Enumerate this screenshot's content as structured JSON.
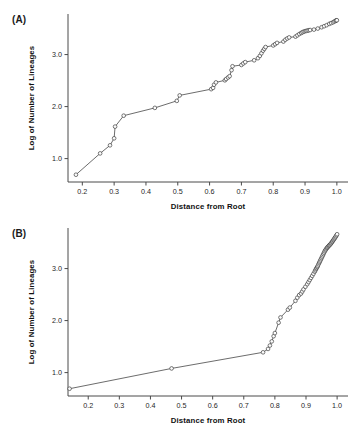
{
  "figure": {
    "background": "#ffffff",
    "line_color": "#3b3b3b",
    "marker_edge_color": "#2a2a2a",
    "marker_face_color": "#fbfbfb",
    "axis_color": "#4a4a4a"
  },
  "panels": [
    {
      "id": "A",
      "label": "(A)"
    },
    {
      "id": "B",
      "label": "(B)"
    }
  ],
  "chart_data": [
    {
      "type": "line",
      "panel": "A",
      "title": "(A)",
      "xlabel": "Distance from Root",
      "ylabel": "Log of Number of Lineages",
      "xlim": [
        0.155,
        1.035
      ],
      "ylim": [
        0.55,
        3.78
      ],
      "xticks": [
        0.2,
        0.3,
        0.4,
        0.5,
        0.6,
        0.7,
        0.8,
        0.9,
        1.0
      ],
      "xticklabels": [
        "0.2",
        "0.3",
        "0.4",
        "0.5",
        "0.6",
        "0.7",
        "0.8",
        "0.9",
        "1.0"
      ],
      "yticks": [
        1.0,
        2.0,
        3.0
      ],
      "yticklabels": [
        "1.0",
        "2.0",
        "3.0"
      ],
      "grid": false,
      "legend": "none",
      "marker": "open-circle",
      "x": [
        0.18,
        0.256,
        0.287,
        0.3,
        0.303,
        0.33,
        0.428,
        0.497,
        0.506,
        0.605,
        0.611,
        0.614,
        0.62,
        0.648,
        0.652,
        0.658,
        0.663,
        0.669,
        0.672,
        0.7,
        0.706,
        0.712,
        0.74,
        0.752,
        0.758,
        0.763,
        0.768,
        0.772,
        0.776,
        0.8,
        0.806,
        0.812,
        0.832,
        0.838,
        0.844,
        0.85,
        0.87,
        0.876,
        0.882,
        0.888,
        0.892,
        0.896,
        0.9,
        0.904,
        0.908,
        0.912,
        0.916,
        0.928,
        0.94,
        0.952,
        0.96,
        0.968,
        0.976,
        0.982,
        0.988,
        0.992,
        0.996,
        0.998,
        1.0
      ],
      "y": [
        0.69,
        1.1,
        1.255,
        1.39,
        1.615,
        1.825,
        1.975,
        2.11,
        2.215,
        2.335,
        2.36,
        2.42,
        2.465,
        2.505,
        2.53,
        2.56,
        2.585,
        2.7,
        2.775,
        2.8,
        2.83,
        2.855,
        2.89,
        2.93,
        2.975,
        3.025,
        3.075,
        3.11,
        3.145,
        3.175,
        3.2,
        3.225,
        3.25,
        3.285,
        3.31,
        3.33,
        3.345,
        3.37,
        3.395,
        3.415,
        3.43,
        3.44,
        3.45,
        3.455,
        3.46,
        3.468,
        3.472,
        3.48,
        3.5,
        3.525,
        3.545,
        3.565,
        3.59,
        3.605,
        3.62,
        3.635,
        3.648,
        3.655,
        3.66
      ]
    },
    {
      "type": "line",
      "panel": "B",
      "title": "(B)",
      "xlabel": "Distance from Root",
      "ylabel": "Log of Number of Lineages",
      "xlim": [
        0.135,
        1.035
      ],
      "ylim": [
        0.55,
        3.78
      ],
      "xticks": [
        0.2,
        0.3,
        0.4,
        0.5,
        0.6,
        0.7,
        0.8,
        0.9,
        1.0
      ],
      "xticklabels": [
        "0.2",
        "0.3",
        "0.4",
        "0.5",
        "0.6",
        "0.7",
        "0.8",
        "0.9",
        "1.0"
      ],
      "yticks": [
        1.0,
        2.0,
        3.0
      ],
      "yticklabels": [
        "1.0",
        "2.0",
        "3.0"
      ],
      "grid": false,
      "legend": "none",
      "marker": "open-circle",
      "x": [
        0.14,
        0.468,
        0.762,
        0.778,
        0.784,
        0.79,
        0.796,
        0.8,
        0.812,
        0.818,
        0.842,
        0.848,
        0.866,
        0.872,
        0.878,
        0.884,
        0.888,
        0.892,
        0.898,
        0.904,
        0.908,
        0.912,
        0.916,
        0.92,
        0.924,
        0.928,
        0.93,
        0.932,
        0.934,
        0.936,
        0.938,
        0.94,
        0.942,
        0.944,
        0.946,
        0.948,
        0.95,
        0.952,
        0.954,
        0.956,
        0.958,
        0.96,
        0.962,
        0.964,
        0.966,
        0.968,
        0.97,
        0.972,
        0.974,
        0.976,
        0.978,
        0.98,
        0.982,
        0.984,
        0.986,
        0.988,
        0.99,
        0.992,
        0.994,
        0.996,
        0.998,
        1.0
      ],
      "y": [
        0.69,
        1.08,
        1.39,
        1.455,
        1.52,
        1.6,
        1.7,
        1.76,
        1.96,
        2.06,
        2.21,
        2.25,
        2.38,
        2.44,
        2.49,
        2.52,
        2.56,
        2.6,
        2.65,
        2.7,
        2.74,
        2.78,
        2.82,
        2.86,
        2.9,
        2.94,
        2.965,
        2.99,
        3.01,
        3.03,
        3.05,
        3.08,
        3.105,
        3.13,
        3.155,
        3.18,
        3.205,
        3.23,
        3.255,
        3.28,
        3.305,
        3.33,
        3.35,
        3.368,
        3.385,
        3.4,
        3.415,
        3.428,
        3.44,
        3.452,
        3.465,
        3.48,
        3.495,
        3.512,
        3.53,
        3.548,
        3.565,
        3.582,
        3.6,
        3.62,
        3.64,
        3.66
      ]
    }
  ]
}
